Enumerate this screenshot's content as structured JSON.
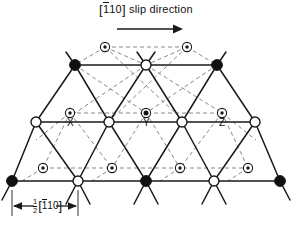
{
  "figure": {
    "type": "crystal-lattice-diagram",
    "title": {
      "direction_prefix": "[",
      "direction_bar_char": "1",
      "direction_rest": "10",
      "direction_suffix": "]",
      "text": "[1̅10] slip direction",
      "label": "slip direction",
      "arrow_icon": "right-arrow-icon"
    },
    "scale_bar": {
      "fraction_numerator": "1",
      "fraction_denominator": "2",
      "bracket_open": "[",
      "bar_char": "1",
      "rest": "10",
      "bracket_close": "]",
      "text": "½[1̅10]"
    },
    "atom_labels": [
      {
        "name": "X",
        "text": "X"
      },
      {
        "name": "Y",
        "text": "Y"
      },
      {
        "name": "Z",
        "text": "Z"
      }
    ],
    "legend_semantics": {
      "filled_circle": "A-type lattice atom",
      "open_circle": "B-type lattice atom",
      "circled_dot": "interstitial site",
      "circled_filled_dot": "occupied interstitial site"
    },
    "colors": {
      "line": "#1a1a1a",
      "dashed": "#6b6b6b",
      "fill_dark": "#111111",
      "fill_light": "#ffffff",
      "background": "#ffffff"
    },
    "geometry": {
      "rows": [
        {
          "index": 0,
          "y": 47,
          "atoms": [
            {
              "x": 105,
              "t": "dot"
            },
            {
              "x": 187,
              "t": "dot"
            }
          ]
        },
        {
          "index": 1,
          "y": 65,
          "atoms": [
            {
              "x": 75,
              "t": "filled"
            },
            {
              "x": 146,
              "t": "open"
            },
            {
              "x": 217,
              "t": "filled"
            }
          ]
        },
        {
          "index": 2,
          "y": 113,
          "atoms": [
            {
              "x": 70,
              "t": "dot"
            },
            {
              "x": 146,
              "t": "dotfill"
            },
            {
              "x": 222,
              "t": "dot"
            }
          ]
        },
        {
          "index": 3,
          "y": 122,
          "atoms": [
            {
              "x": 36,
              "t": "open"
            },
            {
              "x": 109,
              "t": "open"
            },
            {
              "x": 182,
              "t": "open"
            },
            {
              "x": 255,
              "t": "open"
            }
          ]
        },
        {
          "index": 4,
          "y": 168,
          "atoms": [
            {
              "x": 43,
              "t": "dot"
            },
            {
              "x": 112,
              "t": "dot"
            },
            {
              "x": 180,
              "t": "dot"
            },
            {
              "x": 248,
              "t": "dot"
            }
          ]
        },
        {
          "index": 5,
          "y": 181,
          "atoms": [
            {
              "x": 12,
              "t": "filled"
            },
            {
              "x": 78,
              "t": "open"
            },
            {
              "x": 146,
              "t": "filled"
            },
            {
              "x": 214,
              "t": "open"
            },
            {
              "x": 280,
              "t": "filled"
            }
          ]
        }
      ]
    }
  }
}
